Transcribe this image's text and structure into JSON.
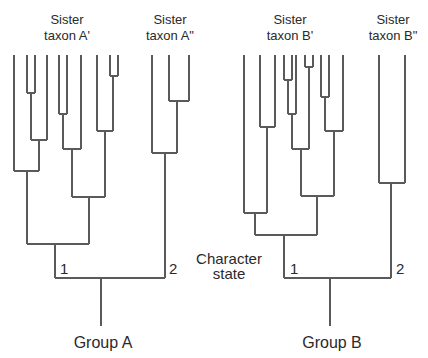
{
  "figure": {
    "type": "phylogenetic-tree-comparison",
    "line_color": "#5a5a5a",
    "text_color": "#2a2a2a",
    "background": "#ffffff"
  },
  "labels": {
    "sister_taxon_A1": {
      "line1": "Sister",
      "line2": "taxon A'"
    },
    "sister_taxon_A2": {
      "line1": "Sister",
      "line2": "taxon A\""
    },
    "sister_taxon_B1": {
      "line1": "Sister",
      "line2": "taxon B'"
    },
    "sister_taxon_B2": {
      "line1": "Sister",
      "line2": "taxon B\""
    },
    "character_state": {
      "line1": "Character",
      "line2": "state"
    },
    "group_A": "Group A",
    "group_B": "Group B",
    "state_A1": "1",
    "state_A2": "2",
    "state_B1": "1",
    "state_B2": "2"
  },
  "trees": [
    {
      "name": "Group A",
      "branches": [
        [
          14,
          55,
          14,
          171
        ],
        [
          27,
          55,
          27,
          93
        ],
        [
          35,
          55,
          35,
          93
        ],
        [
          27,
          93,
          35,
          93
        ],
        [
          31,
          93,
          31,
          140
        ],
        [
          47,
          55,
          47,
          140
        ],
        [
          31,
          140,
          47,
          140
        ],
        [
          39,
          140,
          39,
          171
        ],
        [
          14,
          171,
          39,
          171
        ],
        [
          27,
          171,
          27,
          244
        ],
        [
          59,
          55,
          59,
          114
        ],
        [
          67,
          55,
          67,
          114
        ],
        [
          59,
          114,
          67,
          114
        ],
        [
          63,
          114,
          63,
          149
        ],
        [
          81,
          55,
          81,
          149
        ],
        [
          63,
          149,
          81,
          149
        ],
        [
          72,
          149,
          72,
          197
        ],
        [
          97,
          55,
          97,
          131
        ],
        [
          110,
          55,
          110,
          76
        ],
        [
          118,
          55,
          118,
          76
        ],
        [
          110,
          76,
          118,
          76
        ],
        [
          113,
          76,
          113,
          131
        ],
        [
          97,
          131,
          113,
          131
        ],
        [
          105,
          131,
          105,
          197
        ],
        [
          72,
          197,
          105,
          197
        ],
        [
          89,
          197,
          89,
          244
        ],
        [
          27,
          244,
          89,
          244
        ],
        [
          55,
          244,
          55,
          278
        ],
        [
          152,
          55,
          152,
          153
        ],
        [
          169,
          55,
          169,
          101
        ],
        [
          189,
          55,
          189,
          101
        ],
        [
          169,
          101,
          189,
          101
        ],
        [
          177,
          101,
          177,
          153
        ],
        [
          152,
          153,
          177,
          153
        ],
        [
          165,
          153,
          165,
          278
        ],
        [
          55,
          278,
          165,
          278
        ],
        [
          101,
          278,
          101,
          326
        ]
      ]
    },
    {
      "name": "Group B",
      "branches": [
        [
          244,
          55,
          244,
          213
        ],
        [
          260,
          55,
          260,
          127
        ],
        [
          275,
          55,
          275,
          127
        ],
        [
          260,
          127,
          275,
          127
        ],
        [
          267,
          127,
          267,
          213
        ],
        [
          244,
          213,
          267,
          213
        ],
        [
          255,
          213,
          255,
          235
        ],
        [
          284,
          55,
          284,
          80
        ],
        [
          292,
          55,
          292,
          80
        ],
        [
          284,
          80,
          292,
          80
        ],
        [
          288,
          80,
          288,
          114
        ],
        [
          296,
          55,
          296,
          114
        ],
        [
          288,
          114,
          296,
          114
        ],
        [
          292,
          114,
          292,
          149
        ],
        [
          305,
          55,
          305,
          67
        ],
        [
          313,
          55,
          313,
          67
        ],
        [
          305,
          67,
          313,
          67
        ],
        [
          309,
          67,
          309,
          149
        ],
        [
          292,
          149,
          309,
          149
        ],
        [
          301,
          149,
          301,
          196
        ],
        [
          321,
          55,
          321,
          97
        ],
        [
          329,
          55,
          329,
          97
        ],
        [
          321,
          97,
          329,
          97
        ],
        [
          325,
          97,
          325,
          131
        ],
        [
          343,
          55,
          343,
          131
        ],
        [
          325,
          131,
          343,
          131
        ],
        [
          334,
          131,
          334,
          196
        ],
        [
          301,
          196,
          334,
          196
        ],
        [
          317,
          196,
          317,
          235
        ],
        [
          255,
          235,
          317,
          235
        ],
        [
          284,
          235,
          284,
          278
        ],
        [
          379,
          55,
          379,
          183
        ],
        [
          405,
          55,
          405,
          183
        ],
        [
          379,
          183,
          405,
          183
        ],
        [
          391,
          183,
          391,
          278
        ],
        [
          284,
          278,
          391,
          278
        ],
        [
          330,
          278,
          330,
          326
        ]
      ]
    }
  ]
}
